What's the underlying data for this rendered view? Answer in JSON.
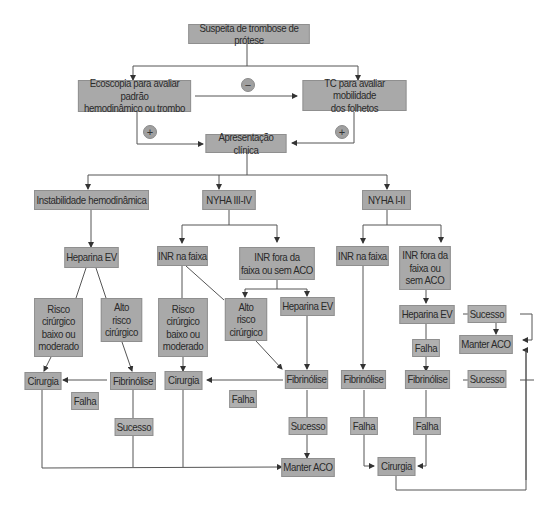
{
  "diagram": {
    "title_node": "Suspeita de trombose de prótese",
    "nodes": {
      "suspeita": "Suspeita de trombose de prótese",
      "ecoscopia": "Ecoscopia para avaliar padrão\nhemodinâmico ou trombo",
      "tc": "TC para avaliar mobilidade\ndos folhetos",
      "apresentacao": "Apresentação clínica",
      "instabilidade": "Instabilidade hemodinâmica",
      "nyha34": "NYHA III-IV",
      "nyha12": "NYHA I-II",
      "heparina_left": "Heparina EV",
      "risco_baixo_left": "Risco\ncirúrgico\nbaixo ou\nmoderado",
      "alto_risco_left": "Alto\nrisco\ncirúrgico",
      "cirurgia_left": "Cirurgia",
      "fibrinolise_left": "Fibrinólise",
      "falha_left": "Falha",
      "sucesso_left": "Sucesso",
      "inr_na_faixa_mid": "INR na faixa",
      "inr_fora_mid": "INR fora da\nfaixa ou sem ACO",
      "risco_baixo_mid": "Risco\ncirúrgico\nbaixo ou\nmoderado",
      "alto_risco_mid": "Alto\nrisco\ncirúrgico",
      "heparina_mid": "Heparina EV",
      "cirurgia_mid": "Cirurgia",
      "falha_mid": "Falha",
      "fibrinolise_mid": "Fibrinólise",
      "sucesso_mid": "Sucesso",
      "manter_aco_bottom": "Manter ACO",
      "inr_na_faixa_right": "INR na faixa",
      "inr_fora_right": "INR fora da\nfaixa ou\nsem ACO",
      "fibrinolise_right_a": "Fibrinólise",
      "falha_right_a": "Falha",
      "heparina_right": "Heparina EV",
      "sucesso_right_a": "Sucesso",
      "manter_aco_right": "Manter ACO",
      "falha_right_b": "Falha",
      "fibrinolise_right_b": "Fibrinólise",
      "sucesso_right_b": "Sucesso",
      "falha_right_c": "Falha",
      "cirurgia_right": "Cirurgia"
    },
    "markers": {
      "negative": "−",
      "positive_left": "+",
      "positive_right": "+"
    },
    "colors": {
      "box_fill": "#a9a9a9",
      "line": "#555555",
      "background": "#ffffff"
    }
  }
}
